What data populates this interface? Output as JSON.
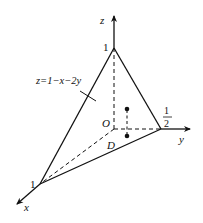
{
  "diagram": {
    "type": "3d-tetrahedron-region",
    "axes": {
      "x_label": "x",
      "y_label": "y",
      "z_label": "z"
    },
    "origin_label": "O",
    "intercepts": {
      "z": "1",
      "x": "1",
      "y_num": "1",
      "y_den": "2"
    },
    "plane_label": "z=1−x−2y",
    "region_label": "D",
    "colors": {
      "stroke": "#111111",
      "background": "#ffffff"
    }
  }
}
